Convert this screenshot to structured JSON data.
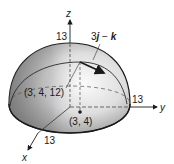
{
  "figure": {
    "axes": {
      "z_label": "z",
      "y_label": "y",
      "x_label": "x"
    },
    "radius_labels": {
      "z_radius": "13",
      "y_radius": "13",
      "x_radius": "13"
    },
    "points": {
      "surface_point": "(3, 4, 12)",
      "base_point": "(3, 4)"
    },
    "vector": {
      "coef": "3",
      "i_part": "j",
      "minus": " − ",
      "k_part": "k"
    },
    "colors": {
      "surface_light": "#f2f2f2",
      "surface_shade": "#8c8c8c",
      "outline": "#1a1a1a"
    }
  }
}
